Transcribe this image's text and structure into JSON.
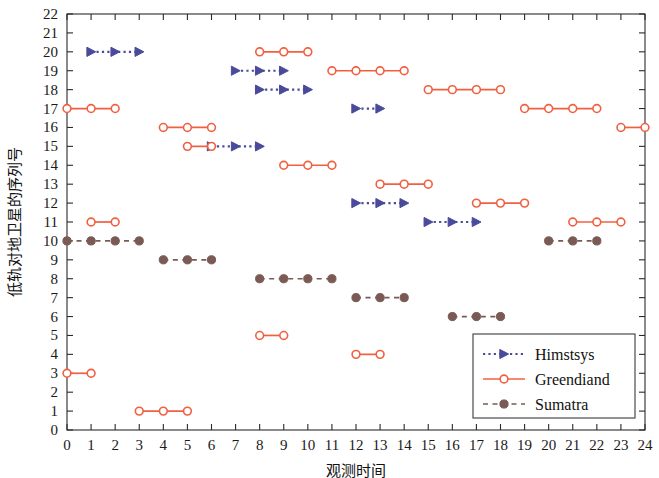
{
  "chart_data": {
    "type": "line",
    "title": "",
    "subtitle": "",
    "xlabel": "观测时间",
    "ylabel": "低轨对地卫星的序列号",
    "xlim": [
      0,
      24
    ],
    "ylim": [
      0,
      22
    ],
    "xticks": [
      0,
      1,
      2,
      3,
      4,
      5,
      6,
      7,
      8,
      9,
      10,
      11,
      12,
      13,
      14,
      15,
      16,
      17,
      18,
      19,
      20,
      21,
      22,
      23,
      24
    ],
    "yticks": [
      0,
      1,
      2,
      3,
      4,
      5,
      6,
      7,
      8,
      9,
      10,
      11,
      12,
      13,
      14,
      15,
      16,
      17,
      18,
      19,
      20,
      21,
      22
    ],
    "grid": false,
    "legend_position": "bottom-right",
    "series": [
      {
        "name": "Himstsys",
        "color": "#4a4a9a",
        "linestyle": "dotted",
        "marker": "right-triangle",
        "segments": [
          {
            "y": 20,
            "x_start": 1,
            "x_end": 3,
            "points": [
              1,
              2,
              3
            ]
          },
          {
            "y": 19,
            "x_start": 7,
            "x_end": 9,
            "points": [
              7,
              8,
              9
            ]
          },
          {
            "y": 18,
            "x_start": 8,
            "x_end": 10,
            "points": [
              8,
              9,
              10
            ]
          },
          {
            "y": 17,
            "x_start": 12,
            "x_end": 13,
            "points": [
              12,
              13
            ]
          },
          {
            "y": 15,
            "x_start": 6,
            "x_end": 8,
            "points": [
              6,
              7,
              8
            ]
          },
          {
            "y": 12,
            "x_start": 12,
            "x_end": 14,
            "points": [
              12,
              13,
              14
            ]
          },
          {
            "y": 11,
            "x_start": 15,
            "x_end": 17,
            "points": [
              15,
              16,
              17
            ]
          }
        ]
      },
      {
        "name": "Greendiand",
        "color": "#f06040",
        "linestyle": "solid",
        "marker": "open-circle",
        "segments": [
          {
            "y": 20,
            "x_start": 8,
            "x_end": 10,
            "points": [
              8,
              9,
              10
            ]
          },
          {
            "y": 19,
            "x_start": 11,
            "x_end": 14,
            "points": [
              11,
              12,
              13,
              14
            ]
          },
          {
            "y": 18,
            "x_start": 15,
            "x_end": 18,
            "points": [
              15,
              16,
              17,
              18
            ]
          },
          {
            "y": 17,
            "x_start": 0,
            "x_end": 2,
            "points": [
              0,
              1,
              2
            ]
          },
          {
            "y": 17,
            "x_start": 19,
            "x_end": 22,
            "points": [
              19,
              20,
              21,
              22
            ]
          },
          {
            "y": 16,
            "x_start": 4,
            "x_end": 6,
            "points": [
              4,
              5,
              6
            ]
          },
          {
            "y": 16,
            "x_start": 23,
            "x_end": 24,
            "points": [
              23,
              24
            ]
          },
          {
            "y": 15,
            "x_start": 5,
            "x_end": 6,
            "points": [
              5,
              6
            ]
          },
          {
            "y": 14,
            "x_start": 9,
            "x_end": 11,
            "points": [
              9,
              10,
              11
            ]
          },
          {
            "y": 13,
            "x_start": 13,
            "x_end": 15,
            "points": [
              13,
              14,
              15
            ]
          },
          {
            "y": 12,
            "x_start": 17,
            "x_end": 19,
            "points": [
              17,
              18,
              19
            ]
          },
          {
            "y": 11,
            "x_start": 1,
            "x_end": 2,
            "points": [
              1,
              2
            ]
          },
          {
            "y": 11,
            "x_start": 21,
            "x_end": 23,
            "points": [
              21,
              22,
              23
            ]
          },
          {
            "y": 5,
            "x_start": 8,
            "x_end": 9,
            "points": [
              8,
              9
            ]
          },
          {
            "y": 4,
            "x_start": 12,
            "x_end": 13,
            "points": [
              12,
              13
            ]
          },
          {
            "y": 3,
            "x_start": 0,
            "x_end": 1,
            "points": [
              0,
              1
            ]
          },
          {
            "y": 1,
            "x_start": 3,
            "x_end": 5,
            "points": [
              3,
              4,
              5
            ]
          }
        ]
      },
      {
        "name": "Sumatra",
        "color": "#7a5a55",
        "linestyle": "dashed",
        "marker": "filled-circle",
        "segments": [
          {
            "y": 10,
            "x_start": 0,
            "x_end": 3,
            "points": [
              0,
              1,
              2,
              3
            ]
          },
          {
            "y": 10,
            "x_start": 20,
            "x_end": 22,
            "points": [
              20,
              21,
              22
            ]
          },
          {
            "y": 9,
            "x_start": 4,
            "x_end": 6,
            "points": [
              4,
              5,
              6
            ]
          },
          {
            "y": 8,
            "x_start": 8,
            "x_end": 11,
            "points": [
              8,
              9,
              10,
              11
            ]
          },
          {
            "y": 7,
            "x_start": 12,
            "x_end": 14,
            "points": [
              12,
              13,
              14
            ]
          },
          {
            "y": 6,
            "x_start": 16,
            "x_end": 18,
            "points": [
              16,
              17,
              18
            ]
          }
        ]
      }
    ],
    "legend": [
      {
        "label": "Himstsys",
        "color": "#4a4a9a",
        "linestyle": "dotted",
        "marker": "right-triangle"
      },
      {
        "label": "Greendiand",
        "color": "#f06040",
        "linestyle": "solid",
        "marker": "open-circle"
      },
      {
        "label": "Sumatra",
        "color": "#7a5a55",
        "linestyle": "dashed",
        "marker": "filled-circle"
      }
    ]
  }
}
